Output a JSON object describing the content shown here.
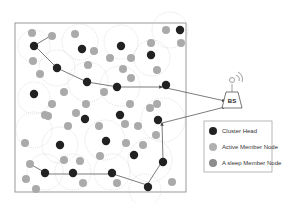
{
  "diagram": {
    "base_station": {
      "label": "BS"
    },
    "legend": [
      {
        "label": "Cluster Head",
        "color": "#222222"
      },
      {
        "label": "Active Member Node",
        "color": "#b0b0b0"
      },
      {
        "label": "A sleep Member Node",
        "color": "#8c8c8c"
      }
    ],
    "colors": {
      "cluster_head": "#222222",
      "active": "#b0b0b0",
      "sleep": "#8c8c8c",
      "frame": "#888888",
      "arrow": "#444444"
    }
  }
}
